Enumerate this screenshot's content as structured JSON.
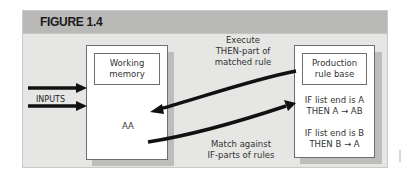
{
  "figure": {
    "title": "FIGURE 1.4",
    "working_memory": {
      "label_line1": "Working",
      "label_line2": "memory",
      "content": "AA"
    },
    "production_rule_base": {
      "label_line1": "Production",
      "label_line2": "rule base",
      "rules": [
        {
          "line1": "IF list end is A",
          "line2": "THEN A → AB"
        },
        {
          "line1": "IF list end is B",
          "line2": "THEN B → A"
        }
      ]
    },
    "inputs_label": "INPUTS",
    "execute_label": {
      "line1": "Execute",
      "line2": "THEN-part of",
      "line3": "matched rule"
    },
    "match_label": {
      "line1": "Match against",
      "line2": "IF-parts of rules"
    },
    "colors": {
      "header": "#b9b9b7",
      "body": "#e6e6e4",
      "shadow": "#bdbdbb",
      "arrow": "#111111"
    }
  }
}
